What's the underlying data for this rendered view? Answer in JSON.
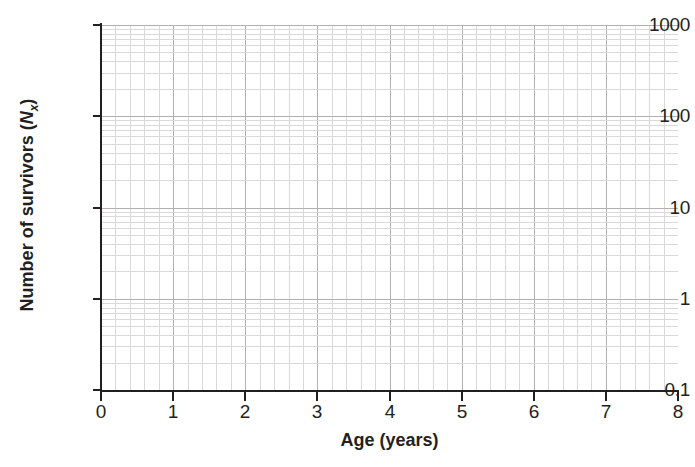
{
  "chart_data": {
    "type": "line",
    "title": "",
    "subtitle": "",
    "xlabel": "Age (years)",
    "ylabel": "Number of survivors (Nx)",
    "ylabel_parts": {
      "prefix": "Number of survivors (",
      "symbol": "N",
      "subscript": "x",
      "suffix": ")"
    },
    "xscale": "linear",
    "yscale": "log",
    "xlim": [
      0,
      8
    ],
    "ylim": [
      0.1,
      1000
    ],
    "x_ticks": [
      0,
      1,
      2,
      3,
      4,
      5,
      6,
      7,
      8
    ],
    "x_tick_labels": [
      "0",
      "1",
      "2",
      "3",
      "4",
      "5",
      "6",
      "7",
      "8"
    ],
    "y_ticks": [
      0.1,
      1,
      10,
      100,
      1000
    ],
    "y_tick_labels": [
      "0.1",
      "1",
      "10",
      "100",
      "1000"
    ],
    "x_minor_step": 0.2,
    "grid": true,
    "grid_major_color": "#b0b0b0",
    "grid_minor_color": "#d9d9d9",
    "axis_color": "#231f20",
    "background_color": "#ffffff",
    "legend": null,
    "legend_position": "none",
    "series": [],
    "annotations": [],
    "note": "Empty semi-log survivorship plot grid with no plotted data points"
  },
  "axes": {
    "y_axis_label": "Number of survivors (Nx)",
    "x_axis_label": "Age (years)"
  }
}
